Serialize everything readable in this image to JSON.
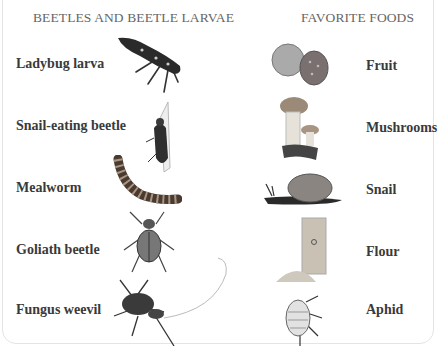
{
  "headers": {
    "left": "BEETLES AND BEETLE LARVAE",
    "right": "FAVORITE FOODS"
  },
  "beetles": [
    {
      "label": "Ladybug larva",
      "icon": "ladybug-larva-image"
    },
    {
      "label": "Snail-eating beetle",
      "icon": "snail-eating-beetle-image"
    },
    {
      "label": "Mealworm",
      "icon": "mealworm-image"
    },
    {
      "label": "Goliath beetle",
      "icon": "goliath-beetle-image"
    },
    {
      "label": "Fungus weevil",
      "icon": "fungus-weevil-image"
    }
  ],
  "foods": [
    {
      "label": "Fruit",
      "icon": "fruit-image"
    },
    {
      "label": "Mushrooms",
      "icon": "mushrooms-image"
    },
    {
      "label": "Snail",
      "icon": "snail-image"
    },
    {
      "label": "Flour",
      "icon": "flour-image"
    },
    {
      "label": "Aphid",
      "icon": "aphid-image"
    }
  ]
}
